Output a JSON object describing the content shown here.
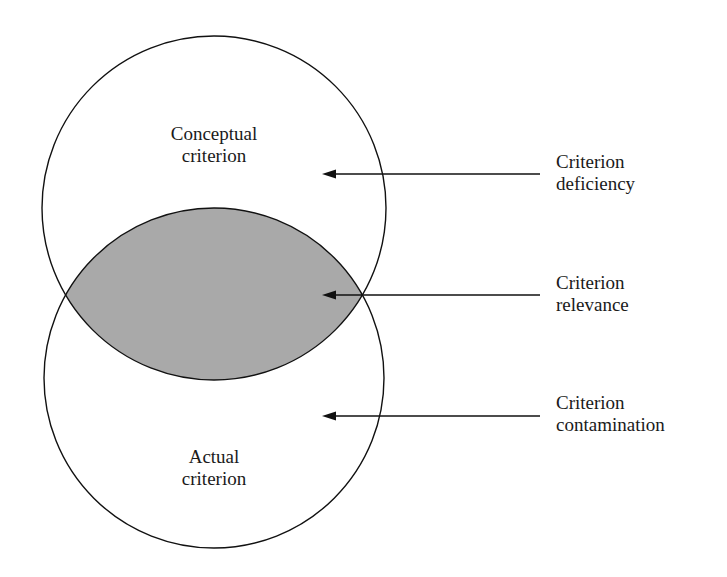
{
  "diagram": {
    "type": "venn",
    "circles": [
      {
        "id": "conceptual",
        "label_line1": "Conceptual",
        "label_line2": "criterion"
      },
      {
        "id": "actual",
        "label_line1": "Actual",
        "label_line2": "criterion"
      }
    ],
    "overlap_fill": "#a9a9a9",
    "annotations": [
      {
        "line1": "Criterion",
        "line2": "deficiency",
        "points_to": "conceptual-only region"
      },
      {
        "line1": "Criterion",
        "line2": "relevance",
        "points_to": "overlap region"
      },
      {
        "line1": "Criterion",
        "line2": "contamination",
        "points_to": "actual-only region"
      }
    ]
  }
}
